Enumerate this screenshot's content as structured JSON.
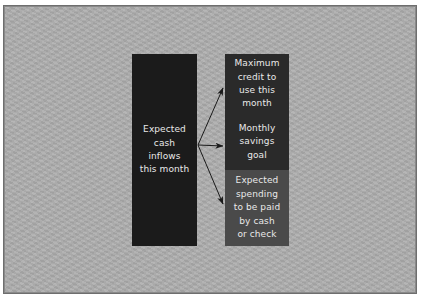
{
  "diagram": {
    "source": {
      "label": "Expected\ncash\ninflows\nthis month"
    },
    "targets": [
      {
        "label": "Maximum\ncredit to\nuse this\nmonth"
      },
      {
        "label": "Monthly\nsavings\ngoal"
      },
      {
        "label": "Expected\nspending\nto be paid\nby cash\nor check"
      }
    ],
    "arrows": [
      {
        "from": "source",
        "to": "targets.0",
        "icon": "arrow-right-icon"
      },
      {
        "from": "source",
        "to": "targets.1",
        "icon": "arrow-right-icon"
      },
      {
        "from": "source",
        "to": "targets.2",
        "icon": "arrow-right-icon"
      }
    ],
    "colors": {
      "background": "#ababab",
      "frame_border": "#6e6e6e",
      "source_fill": "#1b1b1b",
      "target_dark_fill": "#2a2a2a",
      "target_light_fill": "#4a4a4a",
      "text": "#e9e9e9",
      "arrow": "#1a1a1a"
    }
  }
}
